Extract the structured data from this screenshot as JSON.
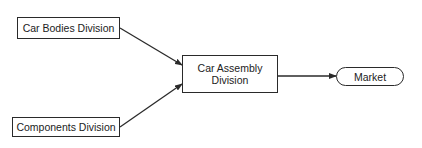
{
  "diagram": {
    "nodes": {
      "car_bodies": {
        "label": "Car Bodies Division"
      },
      "components": {
        "label": "Components Division"
      },
      "car_assembly": {
        "label": "Car Assembly\nDivision"
      },
      "market": {
        "label": "Market"
      }
    },
    "edges": [
      {
        "from": "Car Bodies Division",
        "to": "Car Assembly Division"
      },
      {
        "from": "Components Division",
        "to": "Car Assembly Division"
      },
      {
        "from": "Car Assembly Division",
        "to": "Market"
      }
    ],
    "colors": {
      "stroke": "#2a2a2a",
      "background": "#ffffff",
      "text": "#222222"
    }
  }
}
